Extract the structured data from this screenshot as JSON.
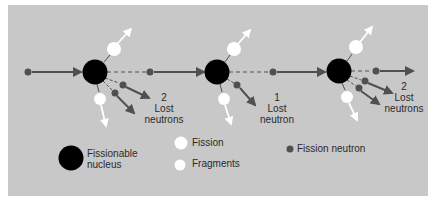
{
  "colors": {
    "background": "#c8c8c8",
    "nucleus": "#000000",
    "fragment": "#ffffff",
    "neutron": "#505050",
    "arrow": "#505050",
    "text": "#2a2a2a"
  },
  "stages": [
    {
      "lost_count": "2",
      "lost_word": "Lost",
      "lost_unit": "neutrons"
    },
    {
      "lost_count": "1",
      "lost_word": "Lost",
      "lost_unit": "neutron"
    },
    {
      "lost_count": "2",
      "lost_word": "Lost",
      "lost_unit": "neutrons"
    }
  ],
  "legend": {
    "nucleus_line1": "Fissionable",
    "nucleus_line2": "nucleus",
    "fragments_line1": "Fission",
    "fragments_line2": "Fragments",
    "neutron": "Fission neutron"
  }
}
